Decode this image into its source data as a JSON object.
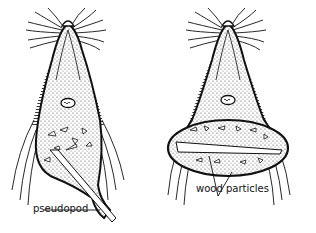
{
  "diagram": {
    "colors": {
      "ink": "#111111",
      "background": "#ffffff",
      "stipple": "#555555"
    },
    "organisms": [
      {
        "id": "left",
        "description": "protozoan extending a pseudopod around a wood particle"
      },
      {
        "id": "right",
        "description": "protozoan with wood particles inside a food vacuole"
      }
    ],
    "labels": {
      "pseudopod": "pseudopod",
      "wood_particles": "wood particles"
    }
  }
}
